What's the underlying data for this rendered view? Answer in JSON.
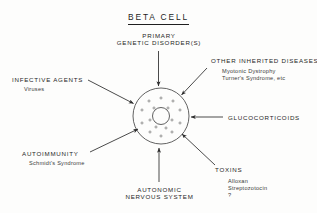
{
  "figure": {
    "title": "BETA CELL",
    "background_color": "#fdfdfc",
    "ink_color": "#2b2b2b"
  },
  "diagram": {
    "cell": {
      "name": "beta-cell",
      "shape": "circle",
      "cx": 161,
      "cy": 116,
      "r": 28,
      "nucleus_r": 8.5
    },
    "granule_count": 16
  },
  "labels": {
    "primary_genetic": {
      "line1": "PRIMARY",
      "line2": "GENETIC DISORDER(S)"
    },
    "other_inherited": {
      "heading": "OTHER INHERITED DISEASES",
      "item1": "Myotonic Dystrophy",
      "item2": "Turner's Syndrome, etc"
    },
    "infective_agents": {
      "heading": "INFECTIVE AGENTS",
      "item1": "Viruses"
    },
    "glucocorticoids": {
      "heading": "GLUCOCORTICOIDS"
    },
    "autoimmunity": {
      "heading": "AUTOIMMUNITY",
      "item1": "Schmidt's Syndrome"
    },
    "toxins": {
      "heading": "TOXINS",
      "item1": "Alloxan",
      "item2": "Streptozotocin",
      "item3": "?"
    },
    "autonomic": {
      "line1": "AUTONOMIC",
      "line2": "NERVOUS  SYSTEM"
    }
  }
}
